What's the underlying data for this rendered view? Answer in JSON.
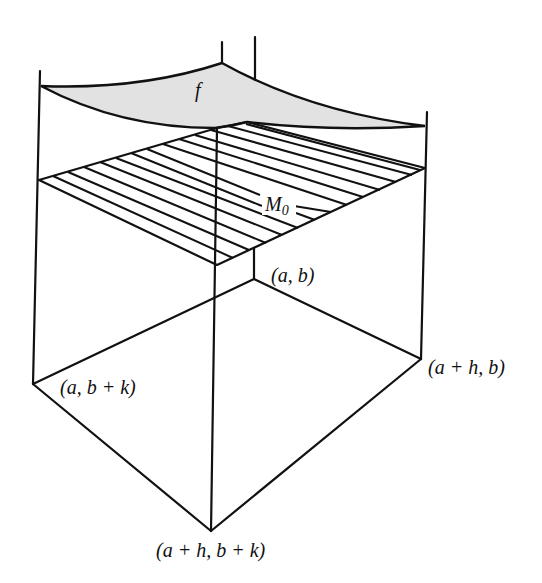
{
  "figure": {
    "surface_label": "f",
    "plane_label": "M",
    "plane_label_sub": "0",
    "points": {
      "a_b": "(a, b)",
      "a_bk": "(a, b + k)",
      "ah_b": "(a + h, b)",
      "ah_bk": "(a + h, b + k)"
    },
    "colors": {
      "surface_fill": "#e2e2e2",
      "line": "#111111",
      "background": "#ffffff"
    },
    "hatch_count": 13
  }
}
